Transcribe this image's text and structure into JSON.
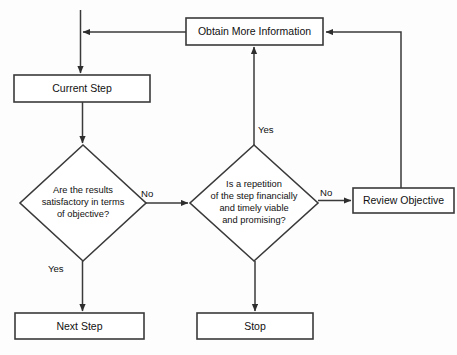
{
  "diagram": {
    "type": "flowchart",
    "canvas": {
      "width": 457,
      "height": 355
    },
    "style": {
      "background": "#fdfdfd",
      "stroke": "#3a3a3a",
      "text": "#111111",
      "node_fill": "#ffffff"
    },
    "nodes": [
      {
        "id": "obtain-more-information",
        "shape": "rectangle",
        "label": "Obtain More Information",
        "x": 186,
        "y": 18,
        "width": 137,
        "height": 27
      },
      {
        "id": "current-step",
        "shape": "rectangle",
        "label": "Current Step",
        "x": 14,
        "y": 75,
        "width": 136,
        "height": 27
      },
      {
        "id": "results-satisfactory",
        "shape": "diamond",
        "label": "Are the results satisfactory in terms of objective?",
        "label_lines": [
          "Are the results",
          "satisfactory in terms",
          "of objective?"
        ],
        "cx": 83,
        "cy": 203,
        "rx": 63,
        "ry": 58
      },
      {
        "id": "repetition-viable",
        "shape": "diamond",
        "label": "Is a repetition of the step financially and timely viable and promising?",
        "label_lines": [
          "Is a repetition",
          "of the step financially",
          "and timely viable",
          "and promising?"
        ],
        "cx": 254,
        "cy": 203,
        "rx": 64,
        "ry": 58
      },
      {
        "id": "review-objective",
        "shape": "rectangle",
        "label": "Review Objective",
        "x": 353,
        "y": 188,
        "width": 101,
        "height": 25
      },
      {
        "id": "next-step",
        "shape": "rectangle",
        "label": "Next Step",
        "x": 15,
        "y": 313,
        "width": 129,
        "height": 26
      },
      {
        "id": "stop",
        "shape": "rectangle",
        "label": "Stop",
        "x": 197,
        "y": 313,
        "width": 116,
        "height": 26
      }
    ],
    "edge_labels": [
      {
        "id": "label-no-left",
        "text": "No",
        "x": 141,
        "y": 188
      },
      {
        "id": "label-no-right",
        "text": "No",
        "x": 320,
        "y": 187
      },
      {
        "id": "label-yes-left",
        "text": "Yes",
        "x": 48,
        "y": 263
      },
      {
        "id": "label-yes-right",
        "text": "Yes",
        "x": 258,
        "y": 124
      }
    ],
    "edges": [
      {
        "id": "edge-entry-to-current-step",
        "from": "top-entry",
        "to": "current-step",
        "label": ""
      },
      {
        "id": "edge-current-step-to-results",
        "from": "current-step",
        "to": "results-satisfactory",
        "label": ""
      },
      {
        "id": "edge-results-yes-to-next-step",
        "from": "results-satisfactory",
        "to": "next-step",
        "label": "Yes"
      },
      {
        "id": "edge-results-no-to-repetition",
        "from": "results-satisfactory",
        "to": "repetition-viable",
        "label": "No"
      },
      {
        "id": "edge-repetition-yes-to-obtain",
        "from": "repetition-viable",
        "to": "obtain-more-information",
        "label": "Yes"
      },
      {
        "id": "edge-repetition-no-to-review",
        "from": "repetition-viable",
        "to": "review-objective",
        "label": "No"
      },
      {
        "id": "edge-repetition-to-stop",
        "from": "repetition-viable",
        "to": "stop",
        "label": ""
      },
      {
        "id": "edge-obtain-to-entry-line",
        "from": "obtain-more-information",
        "to": "top-entry",
        "label": ""
      },
      {
        "id": "edge-review-to-obtain",
        "from": "review-objective",
        "to": "obtain-more-information",
        "label": ""
      }
    ]
  }
}
